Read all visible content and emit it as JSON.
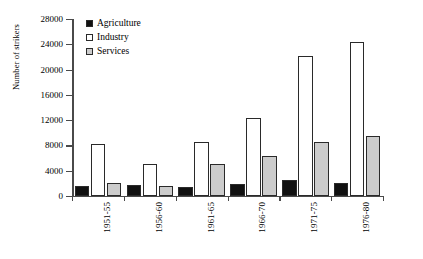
{
  "chart_data": {
    "type": "bar",
    "title": "",
    "xlabel": "",
    "ylabel": "Number of strikers",
    "categories": [
      "1951-55",
      "1956-60",
      "1961-65",
      "1966-70",
      "1971-75",
      "1976-80"
    ],
    "series": [
      {
        "name": "Agriculture",
        "color": "#111111",
        "values": [
          1600,
          1700,
          1400,
          1900,
          2600,
          2100
        ]
      },
      {
        "name": "Industry",
        "color": "#ffffff",
        "values": [
          8200,
          5100,
          8500,
          12300,
          22100,
          24300
        ]
      },
      {
        "name": "Services",
        "color": "#cccccc",
        "values": [
          2100,
          1600,
          5000,
          6400,
          8500,
          9500
        ]
      }
    ],
    "ylim": [
      0,
      28000
    ],
    "yticks": [
      0,
      4000,
      8000,
      12000,
      16000,
      20000,
      24000,
      28000
    ],
    "ytick_labels": [
      "0",
      "4000",
      "8000",
      "12000",
      "16000",
      "20000",
      "24000",
      "28000"
    ],
    "grid": false,
    "legend_position": "top-left"
  }
}
